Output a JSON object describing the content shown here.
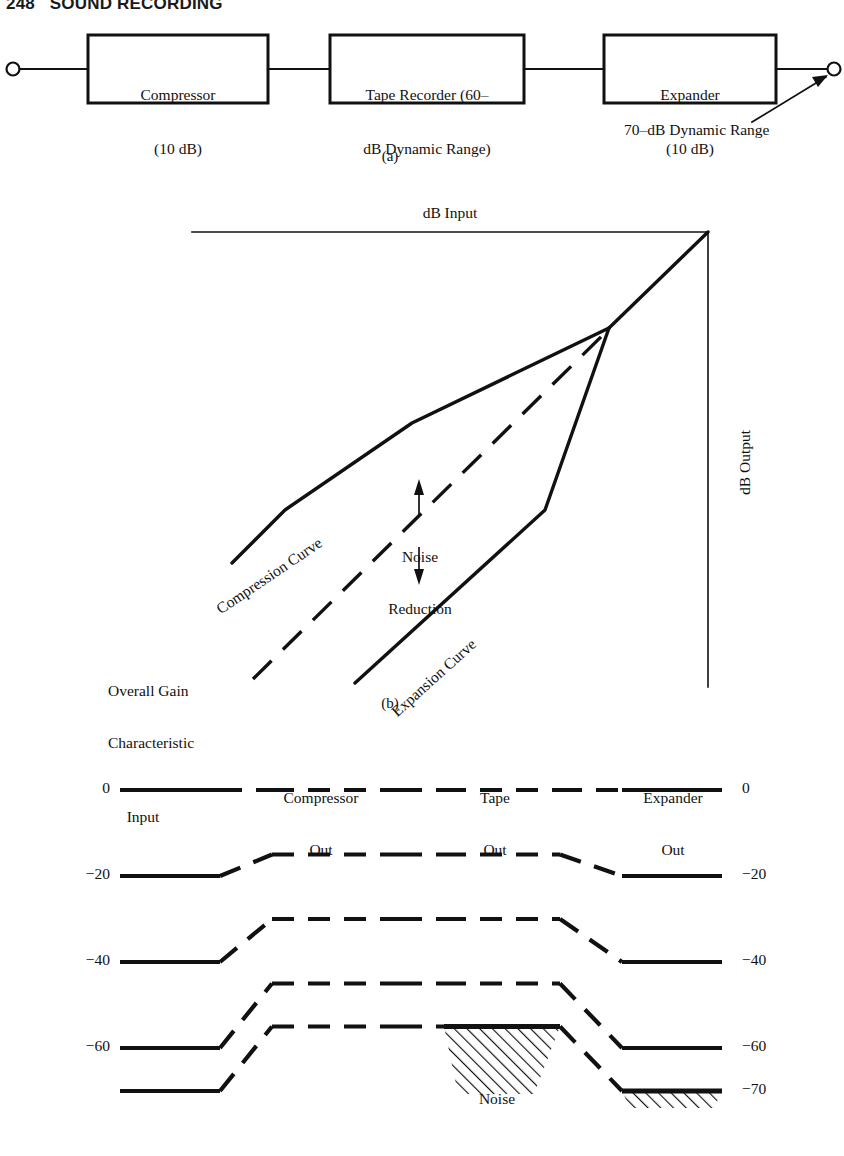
{
  "page": {
    "running_head": "248   SOUND RECORDING",
    "page_number": "248",
    "section_title": "SOUND RECORDING"
  },
  "figure_a": {
    "caption": "(a)",
    "input_terminal": "input-terminal",
    "output_terminal": "output-terminal",
    "blocks": [
      {
        "id": "compressor",
        "line1": "Compressor",
        "line2": "(10 dB)"
      },
      {
        "id": "tape-recorder",
        "line1": "Tape Recorder (60–",
        "line2": "dB Dynamic Range)"
      },
      {
        "id": "expander",
        "line1": "Expander",
        "line2": "(10 dB)"
      }
    ],
    "annotation": "70–dB Dynamic Range"
  },
  "figure_b": {
    "caption": "(b)",
    "x_axis_title": "dB Input",
    "y_axis_title": "dB Output",
    "labels": {
      "compression_curve": "Compression Curve",
      "expansion_curve": "Expansion Curve",
      "noise_reduction_line1": "Noise",
      "noise_reduction_line2": "Reduction",
      "overall_gain_line1": "Overall Gain",
      "overall_gain_line2": "Characteristic"
    }
  },
  "figure_c": {
    "columns": [
      {
        "id": "input",
        "line1": "Input",
        "line2": ""
      },
      {
        "id": "compressor-out",
        "line1": "Compressor",
        "line2": "Out"
      },
      {
        "id": "tape-out",
        "line1": "Tape",
        "line2": "Out"
      },
      {
        "id": "expander-out",
        "line1": "Expander",
        "line2": "Out"
      }
    ],
    "noise_label": "Noise",
    "rows": [
      {
        "id": "row-0",
        "left_label": "0",
        "right_label": "0",
        "input_db": 0,
        "compressor_db": 0,
        "tape_db": 0,
        "expander_db": 0
      },
      {
        "id": "row-20",
        "left_label": "−20",
        "right_label": "−20",
        "input_db": -20,
        "compressor_db": -15,
        "tape_db": -15,
        "expander_db": -20
      },
      {
        "id": "row-40",
        "left_label": "−40",
        "right_label": "−40",
        "input_db": -40,
        "compressor_db": -30,
        "tape_db": -30,
        "expander_db": -40
      },
      {
        "id": "row-60",
        "left_label": "−60",
        "right_label": "−60",
        "input_db": -60,
        "compressor_db": -45,
        "tape_db": -45,
        "expander_db": -60
      },
      {
        "id": "row-70",
        "left_label": "",
        "right_label": "−70",
        "input_db": -70,
        "compressor_db": -55,
        "tape_db": -55,
        "expander_db": -70
      }
    ],
    "noise_floor_db": -60
  },
  "style": {
    "ink": "#111111",
    "paper": "#ffffff"
  }
}
